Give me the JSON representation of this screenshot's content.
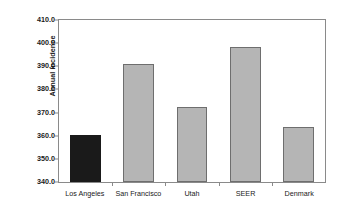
{
  "chart_data": {
    "type": "bar",
    "title": "",
    "xlabel": "",
    "ylabel": "Annual incidence (per 100,000)",
    "ylabel_line1": "Annual incidence",
    "ylabel_line2": "(per 100,000)",
    "categories": [
      "Los Angeles",
      "San Francisco",
      "Utah",
      "SEER",
      "Denmark"
    ],
    "values": [
      360.3,
      391.0,
      372.2,
      398.5,
      363.9
    ],
    "ylim": [
      340.0,
      410.0
    ],
    "ytick_step": 10.0,
    "ytick_labels": [
      "410.0",
      "400.0",
      "390.0",
      "380.0",
      "370.0",
      "360.0",
      "350.0",
      "340.0"
    ],
    "ytick_values": [
      410.0,
      400.0,
      390.0,
      380.0,
      370.0,
      360.0,
      350.0,
      340.0
    ],
    "grid": false,
    "legend": null,
    "bar_colors": [
      "#1a1a1a",
      "#b5b5b5",
      "#b5b5b5",
      "#b5b5b5",
      "#b5b5b5"
    ],
    "bar_border_color": "#6e6e6e",
    "highlight_color": "#1a1a1a",
    "series_color": "#b5b5b5",
    "frame_color": "#8a8a8a",
    "background": "#ffffff"
  }
}
